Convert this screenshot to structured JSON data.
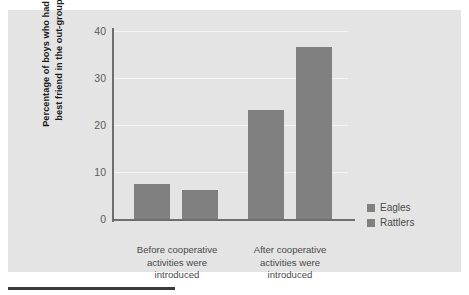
{
  "chart_data": {
    "type": "bar",
    "title": "",
    "xlabel": "",
    "ylabel": "Percentage of boys who had a best friend in the out-group",
    "ylabel_line1": "Percentage of boys who had a",
    "ylabel_line2": "best friend in the out-group",
    "categories": [
      "Before cooperative activities were introduced",
      "After cooperative activities were introduced"
    ],
    "category_lines": [
      [
        "Before cooperative",
        "activities were",
        "introduced"
      ],
      [
        "After cooperative",
        "activities were",
        "introduced"
      ]
    ],
    "series": [
      {
        "name": "Eagles",
        "values": [
          7.4,
          23.2
        ]
      },
      {
        "name": "Rattlers",
        "values": [
          6.2,
          36.6
        ]
      }
    ],
    "ylim": [
      0,
      40
    ],
    "yticks": [
      40,
      30,
      20,
      10,
      0
    ],
    "ytick_labels": [
      "40",
      "30",
      "20",
      "10",
      "0"
    ],
    "grid": true,
    "grid_axis": "y",
    "legend": [
      "Eagles",
      "Rattlers"
    ],
    "legend_position": "right-lower",
    "bar_color": "#808080",
    "panel_color": "#e4e4e4",
    "grid_color": "#f4f4f4",
    "axis_color": "#6e6e6e"
  },
  "axis": {
    "ticks": [
      {
        "label": "40",
        "value": 40
      },
      {
        "label": "30",
        "value": 30
      },
      {
        "label": "20",
        "value": 20
      },
      {
        "label": "10",
        "value": 10
      },
      {
        "label": "0",
        "value": 0
      }
    ]
  },
  "bars": [
    {
      "name": "bar-eagles-before",
      "series": "Eagles",
      "category": 0,
      "value": 7.4
    },
    {
      "name": "bar-rattlers-before",
      "series": "Rattlers",
      "category": 0,
      "value": 6.2
    },
    {
      "name": "bar-eagles-after",
      "series": "Eagles",
      "category": 1,
      "value": 23.2
    },
    {
      "name": "bar-rattlers-after",
      "series": "Rattlers",
      "category": 1,
      "value": 36.6
    }
  ]
}
